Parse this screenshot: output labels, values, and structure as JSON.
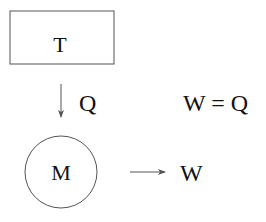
{
  "diagram": {
    "reservoir": {
      "label": "T",
      "shape": "rectangle"
    },
    "heat_flow": {
      "label": "Q",
      "direction": "down"
    },
    "machine": {
      "label": "M",
      "shape": "circle"
    },
    "work_output": {
      "label": "W",
      "direction": "right"
    },
    "equation": {
      "text": "W = Q"
    }
  },
  "colors": {
    "stroke": "#555555",
    "text": "#111111",
    "background": "#ffffff"
  }
}
